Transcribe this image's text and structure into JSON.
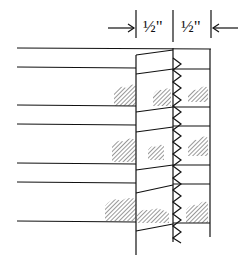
{
  "diagram": {
    "type": "seam-allowance-illustration",
    "dimensions": [
      {
        "label": "½\"",
        "from_x": 136,
        "to_x": 173
      },
      {
        "label": "½\"",
        "from_x": 173,
        "to_x": 211
      }
    ],
    "labels": {
      "left_dim": "½\"",
      "right_dim": "½\""
    },
    "colors": {
      "line": "#111111",
      "background": "#ffffff"
    },
    "fabric_lines_y": [
      48,
      67,
      105,
      124,
      162,
      181,
      220
    ],
    "stitch": "zigzag"
  }
}
